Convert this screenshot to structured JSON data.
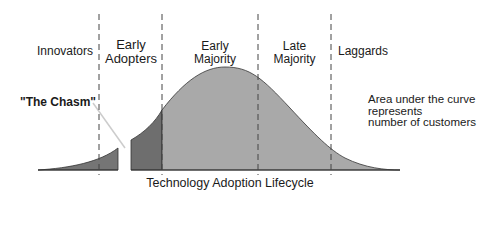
{
  "diagram": {
    "title": "Technology Adoption Lifecycle",
    "segments": [
      {
        "label_line1": "Innovators",
        "label_line2": ""
      },
      {
        "label_line1": "Early",
        "label_line2": "Adopters"
      },
      {
        "label_line1": "Early",
        "label_line2": "Majority"
      },
      {
        "label_line1": "Late",
        "label_line2": "Majority"
      },
      {
        "label_line1": "Laggards",
        "label_line2": ""
      }
    ],
    "chasm_label": "\"The Chasm\"",
    "note_lines": [
      "Area under the curve",
      "represents",
      "number of customers"
    ],
    "colors": {
      "curve_fill": "#a9a9a9",
      "early_adopters_fill": "#6e6e6e",
      "innovators_fill": "#757575",
      "outline": "#333333",
      "dashes": "#444444"
    }
  }
}
